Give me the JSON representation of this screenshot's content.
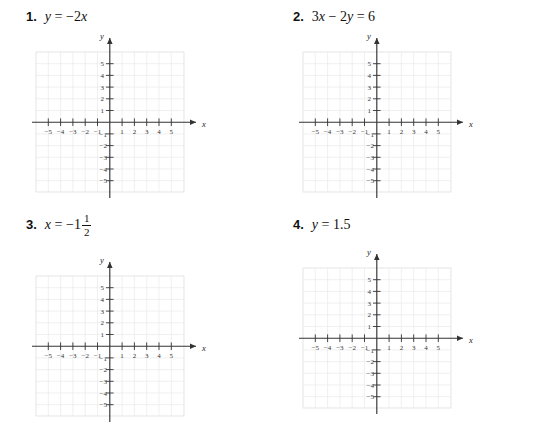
{
  "page": {
    "background_color": "#ffffff",
    "axis_color": "#333333",
    "grid_color": "#e9e9ec"
  },
  "problems": [
    {
      "number": "1.",
      "equation_text": "y = -2x",
      "equation": {
        "lhs": "y",
        "relation": "=",
        "rhs_sign": "−",
        "rhs_coefficient": "2",
        "rhs_variable": "x"
      },
      "graph": {
        "x_label": "x",
        "y_label": "y",
        "x_ticks": [
          "−5",
          "−4",
          "−3",
          "−2",
          "−1",
          "1",
          "2",
          "3",
          "4",
          "5"
        ],
        "y_ticks": [
          "5",
          "4",
          "3",
          "2",
          "1",
          "−1",
          "−2",
          "−3",
          "−4",
          "−5"
        ],
        "x_range": [
          -6,
          6
        ],
        "y_range": [
          -6,
          6
        ],
        "grid": true,
        "plotted_line": false
      }
    },
    {
      "number": "2.",
      "equation_text": "3x - 2y = 6",
      "equation": {
        "term1_coefficient": "3",
        "term1_variable": "x",
        "operator": "−",
        "term2_coefficient": "2",
        "term2_variable": "y",
        "relation": "=",
        "rhs": "6"
      },
      "graph": {
        "x_label": "x",
        "y_label": "y",
        "x_ticks": [
          "−5",
          "−4",
          "−3",
          "−2",
          "−1",
          "1",
          "2",
          "3",
          "4",
          "5"
        ],
        "y_ticks": [
          "5",
          "4",
          "3",
          "2",
          "1",
          "−1",
          "−2",
          "−3",
          "−4",
          "−5"
        ],
        "x_range": [
          -6,
          6
        ],
        "y_range": [
          -6,
          6
        ],
        "grid": true,
        "plotted_line": false
      }
    },
    {
      "number": "3.",
      "equation_text": "x = -1 1/2",
      "equation": {
        "lhs": "x",
        "relation": "=",
        "rhs_sign": "−",
        "rhs_whole": "1",
        "rhs_numerator": "1",
        "rhs_denominator": "2"
      },
      "graph": {
        "x_label": "x",
        "y_label": "y",
        "x_ticks": [
          "−5",
          "−4",
          "−3",
          "−2",
          "−1",
          "1",
          "2",
          "3",
          "4",
          "5"
        ],
        "y_ticks": [
          "5",
          "4",
          "3",
          "2",
          "1",
          "−1",
          "−2",
          "−3",
          "−4",
          "−5"
        ],
        "x_range": [
          -6,
          6
        ],
        "y_range": [
          -6,
          6
        ],
        "grid": true,
        "plotted_line": false
      }
    },
    {
      "number": "4.",
      "equation_text": "y = 1.5",
      "equation": {
        "lhs": "y",
        "relation": "=",
        "rhs": "1.5"
      },
      "graph": {
        "x_label": "x",
        "y_label": "y",
        "x_ticks": [
          "−5",
          "−4",
          "−3",
          "−2",
          "−1",
          "1",
          "2",
          "3",
          "4",
          "5"
        ],
        "y_ticks": [
          "5",
          "4",
          "3",
          "2",
          "1",
          "−1",
          "−2",
          "−3",
          "−4",
          "−5"
        ],
        "x_range": [
          -6,
          6
        ],
        "y_range": [
          -6,
          6
        ],
        "grid": true,
        "plotted_line": false
      }
    }
  ]
}
